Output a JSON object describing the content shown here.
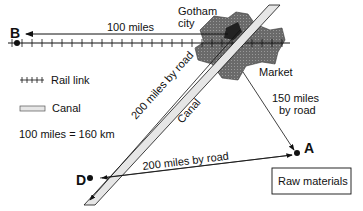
{
  "points": {
    "B": {
      "label": "B"
    },
    "A": {
      "label": "A"
    },
    "D": {
      "label": "D"
    }
  },
  "city": {
    "line1": "Gotham",
    "line2": "city"
  },
  "market": {
    "label": "Market"
  },
  "routes": {
    "b_to_city": "100 miles",
    "city_to_a_line1": "150 miles",
    "city_to_a_line2": "by road",
    "city_to_d": "200 miles by road",
    "a_to_d": "200 miles by road",
    "canal_label": "Canal"
  },
  "legend": {
    "rail": "Rail link",
    "canal": "Canal",
    "scale": "100 miles = 160 km"
  },
  "box": {
    "label": "Raw materials"
  },
  "colors": {
    "ink": "#111111",
    "city_fill": "#666666",
    "canal_fill": "#e6e6e6"
  }
}
